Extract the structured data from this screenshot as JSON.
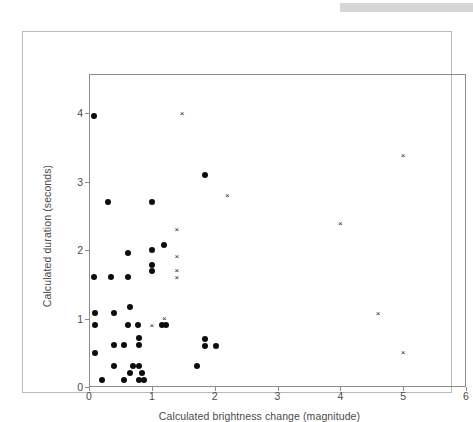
{
  "top_bar": {
    "color": "#d6d6d6"
  },
  "chart_data": {
    "type": "scatter",
    "title": "",
    "xlabel": "Calculated brightness change (magnitude)",
    "ylabel": "Calculated duration (seconds)",
    "xlim": [
      0,
      6
    ],
    "ylim": [
      0,
      4.57
    ],
    "xticks": [
      0,
      1,
      2,
      3,
      4,
      5,
      6
    ],
    "yticks": [
      0,
      1,
      2,
      3,
      4
    ],
    "xtick_labels": [
      "0",
      "1",
      "2",
      "3",
      "4",
      "5",
      "6"
    ],
    "ytick_labels": [
      "0",
      "1",
      "2",
      "3",
      "4"
    ],
    "grid": false,
    "legend": null,
    "marker_colors": {
      "dot": "#0d0d0d",
      "cross": "#1a1a1a"
    },
    "series": [
      {
        "name": "filled-circle",
        "marker": "dot",
        "points": [
          [
            0.08,
            3.95
          ],
          [
            0.3,
            2.7
          ],
          [
            1.0,
            2.7
          ],
          [
            1.85,
            3.1
          ],
          [
            1.2,
            2.08
          ],
          [
            1.0,
            2.0
          ],
          [
            0.62,
            1.95
          ],
          [
            1.0,
            1.78
          ],
          [
            1.0,
            1.7
          ],
          [
            0.08,
            1.6
          ],
          [
            0.35,
            1.6
          ],
          [
            0.62,
            1.6
          ],
          [
            0.65,
            1.17
          ],
          [
            0.1,
            1.08
          ],
          [
            0.4,
            1.08
          ],
          [
            0.1,
            0.9
          ],
          [
            0.62,
            0.9
          ],
          [
            0.78,
            0.9
          ],
          [
            1.16,
            0.9
          ],
          [
            1.22,
            0.9
          ],
          [
            0.8,
            0.72
          ],
          [
            1.85,
            0.7
          ],
          [
            0.4,
            0.62
          ],
          [
            0.55,
            0.62
          ],
          [
            0.8,
            0.62
          ],
          [
            1.85,
            0.6
          ],
          [
            2.02,
            0.6
          ],
          [
            0.1,
            0.5
          ],
          [
            0.4,
            0.3
          ],
          [
            0.7,
            0.3
          ],
          [
            0.8,
            0.3
          ],
          [
            1.72,
            0.3
          ],
          [
            0.65,
            0.2
          ],
          [
            0.85,
            0.2
          ],
          [
            0.2,
            0.1
          ],
          [
            0.55,
            0.1
          ],
          [
            0.8,
            0.1
          ],
          [
            0.88,
            0.1
          ]
        ]
      },
      {
        "name": "cross",
        "marker": "cross",
        "points": [
          [
            1.48,
            4.0
          ],
          [
            5.0,
            3.38
          ],
          [
            2.2,
            2.8
          ],
          [
            4.0,
            2.38
          ],
          [
            1.4,
            2.3
          ],
          [
            1.4,
            1.9
          ],
          [
            1.4,
            1.7
          ],
          [
            1.4,
            1.6
          ],
          [
            4.6,
            1.08
          ],
          [
            1.2,
            1.0
          ],
          [
            1.0,
            0.9
          ],
          [
            5.0,
            0.5
          ]
        ]
      }
    ]
  }
}
